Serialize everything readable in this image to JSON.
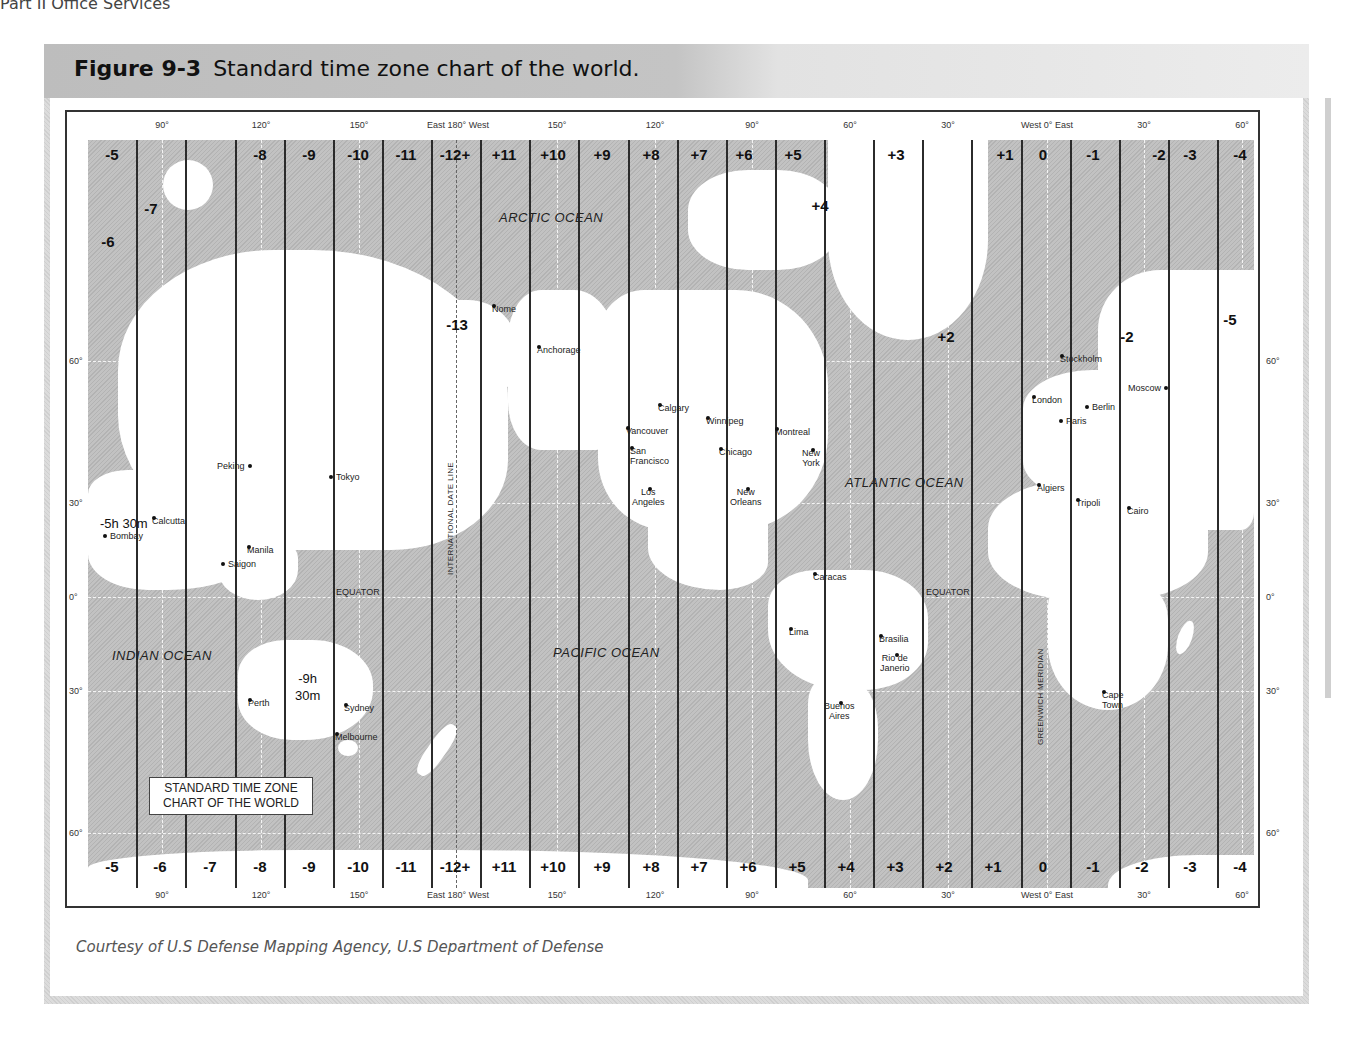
{
  "page_header": "Part II  Office Services",
  "figure": {
    "number": "Figure 9-3",
    "title": "Standard time zone chart of the world.",
    "caption": "Courtesy of U.S Defense Mapping Agency, U.S Department of Defense"
  },
  "map": {
    "legend_box": {
      "line1": "STANDARD TIME ZONE",
      "line2": "CHART OF THE WORLD"
    },
    "top_zone_labels": [
      "-5",
      "-8",
      "-9",
      "-10",
      "-11",
      "-12+",
      "+11",
      "+10",
      "+9",
      "+8",
      "+7",
      "+6",
      "+5",
      "+3",
      "+1",
      "0",
      "-1",
      "-2",
      "-3",
      "-4"
    ],
    "bottom_zone_labels": [
      "-5",
      "-6",
      "-7",
      "-8",
      "-9",
      "-10",
      "-11",
      "-12+",
      "+11",
      "+10",
      "+9",
      "+8",
      "+7",
      "+6",
      "+5",
      "+4",
      "+3",
      "+2",
      "+1",
      "0",
      "-1",
      "-2",
      "-3",
      "-4"
    ],
    "inner_zone_labels": {
      "z_minus7": "-7",
      "z_minus6": "-6",
      "z_minus13": "-13",
      "z_plus4": "+4",
      "z_plus2": "+2",
      "z_minus2": "-2",
      "z_minus5": "-5"
    },
    "special_offsets": {
      "india": "-5h 30m",
      "australia_line1": "-9h",
      "australia_line2": "30m"
    },
    "longitude_labels": [
      "90°",
      "120°",
      "150°",
      "East 180° West",
      "150°",
      "120°",
      "90°",
      "60°",
      "30°",
      "West 0° East",
      "30°",
      "60°"
    ],
    "latitude_labels": [
      "60°",
      "30°",
      "0°",
      "30°",
      "60°"
    ],
    "oceans": {
      "arctic": "ARCTIC OCEAN",
      "atlantic": "ATLANTIC OCEAN",
      "pacific": "PACIFIC OCEAN",
      "indian": "INDIAN OCEAN"
    },
    "lines": {
      "date_line": "INTERNATIONAL DATE LINE",
      "greenwich": "GREENWICH MERIDIAN",
      "equator": "EQUATOR"
    },
    "cities": {
      "peking": "Peking",
      "tokyo": "Tokyo",
      "calcutta": "Calcutta",
      "bombay": "Bombay",
      "manila": "Manila",
      "saigon": "Saigon",
      "perth": "Perth",
      "sydney": "Sydney",
      "melbourne": "Melbourne",
      "nome": "Nome",
      "anchorage": "Anchorage",
      "calgary": "Calgary",
      "vancouver": "Vancouver",
      "san_francisco_1": "San",
      "san_francisco_2": "Francisco",
      "los_angeles_1": "Los",
      "los_angeles_2": "Angeles",
      "winnipeg": "Winnipeg",
      "chicago": "Chicago",
      "new_orleans_1": "New",
      "new_orleans_2": "Orleans",
      "montreal": "Montreal",
      "new_york_1": "New",
      "new_york_2": "York",
      "caracas": "Caracas",
      "lima": "Lima",
      "brasilia": "Brasilia",
      "rio_1": "Rio de",
      "rio_2": "Janerio",
      "buenos_aires_1": "Buenos",
      "buenos_aires_2": "Aires",
      "stockholm": "Stockholm",
      "london": "London",
      "berlin": "Berlin",
      "paris": "Paris",
      "moscow": "Moscow",
      "algiers": "Algiers",
      "tripoli": "Tripoli",
      "cairo": "Cairo",
      "cape_town_1": "Cape",
      "cape_town_2": "Town"
    }
  }
}
